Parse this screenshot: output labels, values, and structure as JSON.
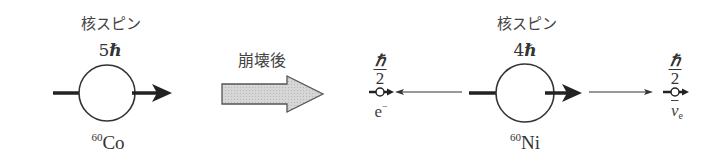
{
  "diagram": {
    "before": {
      "label": "核スピン",
      "spin_value": "5",
      "spin_unit": "ℏ",
      "nucleus_mass_number": "60",
      "nucleus_symbol": "Co"
    },
    "transition": {
      "label": "崩壊後"
    },
    "after": {
      "label": "核スピン",
      "spin_value": "4",
      "spin_unit": "ℏ",
      "nucleus_mass_number": "60",
      "nucleus_symbol": "Ni"
    },
    "electron": {
      "spin_numerator": "ℏ",
      "spin_denominator": "2",
      "symbol": "e",
      "charge": "−"
    },
    "antineutrino": {
      "spin_numerator": "ℏ",
      "spin_denominator": "2",
      "symbol": "ν",
      "subscript": "e"
    },
    "colors": {
      "ink": "#222222",
      "arrow_fill": "#d4d4d4",
      "arrow_stroke": "#555555"
    }
  }
}
